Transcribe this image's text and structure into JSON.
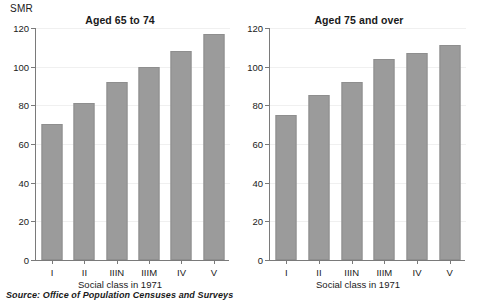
{
  "axis_unit_label": "SMR",
  "source_note": "Source: Office of Population Censuses and Surveys",
  "colors": {
    "bar_fill": "#9b9b9b",
    "bar_edge": "#8e8e8e",
    "axis": "#7a7a7a",
    "gridline": "#f0f0f0",
    "text": "#1a1a1a",
    "background": "#ffffff"
  },
  "panels": [
    {
      "title": "Aged 65 to 74",
      "xlabel": "Social class in 1971",
      "ylabel": "SMR"
    },
    {
      "title": "Aged 75 and over",
      "xlabel": "Social class in 1971",
      "ylabel": "SMR"
    }
  ],
  "chart_data": [
    {
      "type": "bar",
      "title": "Aged 65 to 74",
      "xlabel": "Social class in 1971",
      "ylabel": "SMR",
      "categories": [
        "I",
        "II",
        "IIIN",
        "IIIM",
        "IV",
        "V"
      ],
      "values": [
        70.5,
        81,
        92,
        100,
        108,
        117
      ],
      "ylim": [
        0,
        120
      ],
      "yticks": [
        0,
        20,
        40,
        60,
        80,
        100,
        120
      ],
      "ytick_labels": [
        "0",
        "20",
        "40",
        "60",
        "80",
        "100",
        "120"
      ],
      "grid": true,
      "legend": "none"
    },
    {
      "type": "bar",
      "title": "Aged 75 and over",
      "xlabel": "Social class in 1971",
      "ylabel": "SMR",
      "categories": [
        "I",
        "II",
        "IIIN",
        "IIIM",
        "IV",
        "V"
      ],
      "values": [
        75,
        85.5,
        92,
        104,
        107,
        111
      ],
      "ylim": [
        0,
        120
      ],
      "yticks": [
        0,
        20,
        40,
        60,
        80,
        100,
        120
      ],
      "ytick_labels": [
        "0",
        "20",
        "40",
        "60",
        "80",
        "100",
        "120"
      ],
      "grid": true,
      "legend": "none"
    }
  ]
}
